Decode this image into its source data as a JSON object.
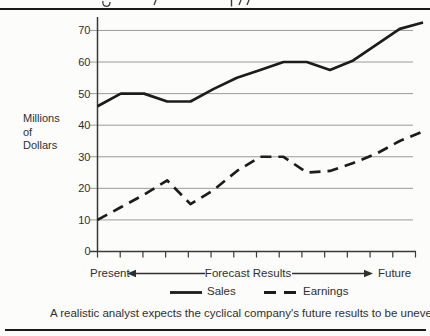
{
  "figure": {
    "caption": "A realistic analyst expects the cyclical company's future results to be uneven."
  },
  "axis_labels": {
    "y_unit_line1": "Millions",
    "y_unit_line2": "of",
    "y_unit_line3": "Dollars",
    "x_left": "Present",
    "x_center": "Forecast Results",
    "x_right": "Future"
  },
  "legend": {
    "sales": "Sales",
    "earnings": "Earnings"
  },
  "chart_data": {
    "type": "line",
    "title": "",
    "ylabel": "Millions of Dollars",
    "xlabel": "Present to Future (Forecast Results)",
    "ylim": [
      0,
      75
    ],
    "y_ticks": [
      0,
      10,
      20,
      30,
      40,
      50,
      60,
      70
    ],
    "x_tick_count": 15,
    "grid": "horizontal gridlines at each labeled y value",
    "legend_position": "below x-axis",
    "x": [
      0,
      1,
      2,
      3,
      4,
      5,
      6,
      7,
      8,
      9,
      10,
      11,
      12,
      13,
      14
    ],
    "series": [
      {
        "name": "Sales",
        "line_style": "solid",
        "values": [
          46,
          50,
          50,
          47.5,
          47.5,
          51.5,
          55,
          57.5,
          60,
          60,
          57.5,
          60.5,
          65.5,
          70.5,
          72.5
        ]
      },
      {
        "name": "Earnings",
        "line_style": "dashed",
        "values": [
          10,
          14,
          18,
          22.5,
          15,
          19.5,
          25.5,
          30,
          30,
          25,
          25.5,
          28,
          31,
          35,
          38
        ]
      }
    ],
    "colors": {
      "line": "#1c1c1c",
      "grid": "#8f8f8f",
      "axis": "#3a3a3a",
      "text": "#2f2f2f",
      "background": "#fcfcfa"
    }
  }
}
